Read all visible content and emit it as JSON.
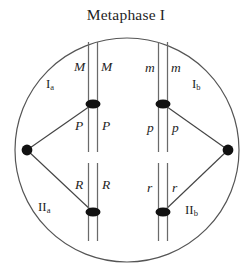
{
  "diagram": {
    "title": "Metaphase I",
    "type": "meiosis-cell-diagram",
    "colors": {
      "ink": "#1f1f1f",
      "membrane": "#555555",
      "chromatid": "#666666",
      "centromere": "#111111",
      "spindle": "#444444",
      "background": "#ffffff"
    },
    "cell": {
      "shape": "circle",
      "center_x": 127,
      "center_y": 150,
      "radius": 112
    },
    "poles": [
      {
        "name": "left-pole",
        "x": 27,
        "y": 150
      },
      {
        "name": "right-pole",
        "x": 228,
        "y": 150
      }
    ],
    "bivalents": [
      {
        "id": "bivalent-top-left",
        "region_label": "I",
        "region_sub": "a",
        "centromere_x": 93,
        "centromere_y": 104,
        "top_alleles": {
          "left": "M",
          "right": "M"
        },
        "bottom_alleles": {
          "left": "P",
          "right": "P"
        }
      },
      {
        "id": "bivalent-top-right",
        "region_label": "I",
        "region_sub": "b",
        "centromere_x": 163,
        "centromere_y": 104,
        "top_alleles": {
          "left": "m",
          "right": "m"
        },
        "bottom_alleles": {
          "left": "p",
          "right": "p"
        }
      },
      {
        "id": "bivalent-bottom-left",
        "region_label": "II",
        "region_sub": "a",
        "centromere_x": 93,
        "centromere_y": 212,
        "top_alleles": {
          "left": "R",
          "right": "R"
        },
        "bottom_alleles": {
          "left": "",
          "right": ""
        }
      },
      {
        "id": "bivalent-bottom-right",
        "region_label": "II",
        "region_sub": "b",
        "centromere_x": 163,
        "centromere_y": 212,
        "top_alleles": {
          "left": "r",
          "right": "r"
        },
        "bottom_alleles": {
          "left": "",
          "right": ""
        }
      }
    ],
    "labels": {
      "M_left": "M",
      "M_right": "M",
      "m_left": "m",
      "m_right": "m",
      "P_left": "P",
      "P_right": "P",
      "p_left": "p",
      "p_right": "p",
      "R_left": "R",
      "R_right": "R",
      "r_left": "r",
      "r_right": "r",
      "Ia_main": "I",
      "Ia_sub": "a",
      "Ib_main": "I",
      "Ib_sub": "b",
      "IIa_main": "II",
      "IIa_sub": "a",
      "IIb_main": "II",
      "IIb_sub": "b"
    }
  }
}
